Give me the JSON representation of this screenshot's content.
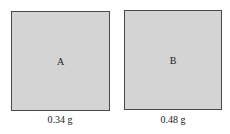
{
  "samples": [
    {
      "label": "A",
      "mass": "0.34 g",
      "fill": "#d4d4d4"
    },
    {
      "label": "B",
      "mass": "0.48 g",
      "fill": "#d4d4d4"
    }
  ]
}
